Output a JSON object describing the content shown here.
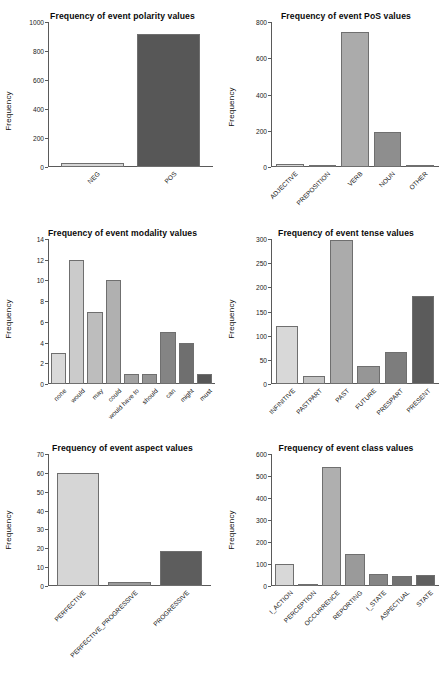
{
  "figure": {
    "layout": "3 rows x 2 columns of bar charts",
    "shared_ylabel": "Frequency"
  },
  "chart_data": [
    {
      "type": "bar",
      "title": "Frequency of event polarity values",
      "categories": [
        "NEG",
        "POS"
      ],
      "values": [
        30,
        915
      ],
      "xlabel": "",
      "ylabel": "Frequency",
      "ylim": [
        0,
        1000
      ],
      "yticks": [
        0,
        200,
        400,
        600,
        800,
        1000
      ],
      "grid": false,
      "legend": "none",
      "bar_colors": [
        "#d6d6d6",
        "#575757"
      ]
    },
    {
      "type": "bar",
      "title": "Frequency of event PoS values",
      "categories": [
        "ADJECTIVE",
        "PREPOSITION",
        "VERB",
        "NOUN",
        "OTHER"
      ],
      "values": [
        18,
        1,
        745,
        192,
        1
      ],
      "xlabel": "",
      "ylabel": "Frequency",
      "ylim": [
        0,
        800
      ],
      "yticks": [
        0,
        200,
        400,
        600,
        800
      ],
      "grid": false,
      "legend": "none",
      "bar_colors": [
        "#d8d8d8",
        "#c2c2c2",
        "#ababab",
        "#8e8e8e",
        "#6e6e6e"
      ]
    },
    {
      "type": "bar",
      "title": "Frequency of event modality values",
      "categories": [
        "none",
        "would",
        "may",
        "could",
        "would have to",
        "should",
        "can",
        "might",
        "must"
      ],
      "values": [
        3,
        12,
        7,
        10,
        1,
        1,
        5,
        4,
        1
      ],
      "xlabel": "",
      "ylabel": "Frequency",
      "ylim": [
        0,
        14
      ],
      "yticks": [
        0,
        2,
        4,
        6,
        8,
        10,
        12,
        14
      ],
      "grid": false,
      "legend": "none",
      "bar_colors": [
        "#d9d9d9",
        "#cbcbcb",
        "#bdbdbd",
        "#b0b0b0",
        "#a2a2a2",
        "#949494",
        "#848484",
        "#6f6f6f",
        "#575757"
      ]
    },
    {
      "type": "bar",
      "title": "Frequency of event tense values",
      "categories": [
        "INFINITIVE",
        "PASTPART",
        "PAST",
        "FUTURE",
        "PRESPART",
        "PRESENT"
      ],
      "values": [
        120,
        17,
        297,
        38,
        67,
        183
      ],
      "xlabel": "",
      "ylabel": "Frequency",
      "ylim": [
        0,
        300
      ],
      "yticks": [
        0,
        50,
        100,
        150,
        200,
        250,
        300
      ],
      "grid": false,
      "legend": "none",
      "bar_colors": [
        "#d8d8d8",
        "#c2c2c2",
        "#ababab",
        "#969696",
        "#7d7d7d",
        "#5b5b5b"
      ]
    },
    {
      "type": "bar",
      "title": "Frequency of event aspect values",
      "categories": [
        "PERFECTIVE",
        "PERFECTIVE_PROGRESSIVE",
        "PROGRESSIVE"
      ],
      "values": [
        60,
        2,
        18.5
      ],
      "xlabel": "",
      "ylabel": "Frequency",
      "ylim": [
        0,
        70
      ],
      "yticks": [
        0,
        10,
        20,
        30,
        40,
        50,
        60,
        70
      ],
      "grid": false,
      "legend": "none",
      "bar_colors": [
        "#d6d6d6",
        "#9b9b9b",
        "#5d5d5d"
      ]
    },
    {
      "type": "bar",
      "title": "Frequency of event class values",
      "categories": [
        "I_ACTION",
        "PERCEPTION",
        "OCCURRENCE",
        "REPORTING",
        "I_STATE",
        "ASPECTUAL",
        "STATE"
      ],
      "values": [
        99,
        7,
        542,
        145,
        55,
        45,
        50
      ],
      "xlabel": "",
      "ylabel": "Frequency",
      "ylim": [
        0,
        600
      ],
      "yticks": [
        0,
        100,
        200,
        300,
        400,
        500,
        600
      ],
      "grid": false,
      "legend": "none",
      "bar_colors": [
        "#d8d8d8",
        "#c4c4c4",
        "#afafaf",
        "#9a9a9a",
        "#858585",
        "#727272",
        "#606060"
      ]
    }
  ]
}
